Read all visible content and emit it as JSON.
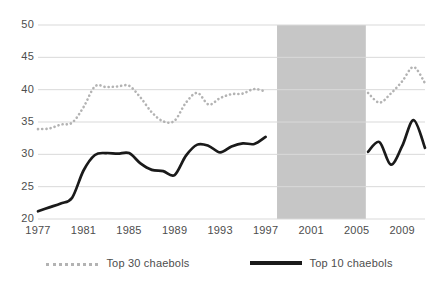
{
  "chart_data": {
    "type": "line",
    "title": "",
    "subtitle": "",
    "xlabel": "",
    "ylabel": "",
    "xlim": [
      1977,
      2011
    ],
    "ylim": [
      20,
      50
    ],
    "yticks": [
      20,
      25,
      30,
      35,
      40,
      45,
      50
    ],
    "xticks": [
      1977,
      1981,
      1985,
      1989,
      1993,
      1997,
      2001,
      2005,
      2009
    ],
    "grid": true,
    "legend_position": "bottom",
    "x": [
      1977,
      1978,
      1979,
      1980,
      1981,
      1982,
      1983,
      1984,
      1985,
      1986,
      1987,
      1988,
      1989,
      1990,
      1991,
      1992,
      1993,
      1994,
      1995,
      1996,
      1997,
      2006,
      2007,
      2008,
      2009,
      2010,
      2011
    ],
    "series": [
      {
        "name": "Top 30 chaebols",
        "style": "dotted",
        "color": "#b3b3b3",
        "x": [
          1977,
          1978,
          1979,
          1980,
          1981,
          1982,
          1983,
          1984,
          1985,
          1986,
          1987,
          1988,
          1989,
          1990,
          1991,
          1992,
          1993,
          1994,
          1995,
          1996,
          1997,
          2006,
          2007,
          2008,
          2009,
          2010,
          2011
        ],
        "values": [
          33.9,
          34.0,
          34.6,
          34.9,
          37.3,
          40.5,
          40.4,
          40.5,
          40.6,
          38.8,
          36.5,
          35.1,
          35.2,
          38.0,
          39.5,
          37.7,
          38.7,
          39.3,
          39.4,
          40.1,
          39.7,
          39.5,
          38.0,
          39.4,
          41.3,
          43.5,
          41.0
        ]
      },
      {
        "name": "Top 10 chaebols",
        "style": "solid",
        "color": "#1a1a1a",
        "x": [
          1977,
          1978,
          1979,
          1980,
          1981,
          1982,
          1983,
          1984,
          1985,
          1986,
          1987,
          1988,
          1989,
          1990,
          1991,
          1992,
          1993,
          1994,
          1995,
          1996,
          1997,
          2006,
          2007,
          2008,
          2009,
          2010,
          2011
        ],
        "values": [
          21.2,
          21.8,
          22.4,
          23.3,
          27.5,
          29.9,
          30.2,
          30.1,
          30.2,
          28.6,
          27.6,
          27.4,
          26.8,
          29.8,
          31.5,
          31.3,
          30.3,
          31.2,
          31.7,
          31.6,
          32.7,
          30.4,
          31.9,
          28.4,
          31.3,
          35.3,
          31.0
        ]
      }
    ],
    "shaded_region": {
      "label": "",
      "x_start": 1998,
      "x_end": 2005.8,
      "color": "#c6c6c6"
    }
  },
  "legend": {
    "entries": [
      {
        "label": "Top 30 chaebols",
        "marker": "dotted-line-swatch"
      },
      {
        "label": "Top 10 chaebols",
        "marker": "solid-line-swatch"
      }
    ]
  },
  "axes": {
    "y_tick_labels": [
      "50",
      "45",
      "40",
      "35",
      "30",
      "25",
      "20"
    ],
    "x_tick_labels": [
      "1977",
      "1981",
      "1985",
      "1989",
      "1993",
      "1997",
      "2001",
      "2005",
      "2009"
    ]
  },
  "colors": {
    "background": "#ffffff",
    "gridline": "#d9d9d9",
    "axis_text": "#4d4d4d",
    "series_top30": "#b3b3b3",
    "series_top10": "#1a1a1a",
    "shaded_band": "#c6c6c6"
  }
}
